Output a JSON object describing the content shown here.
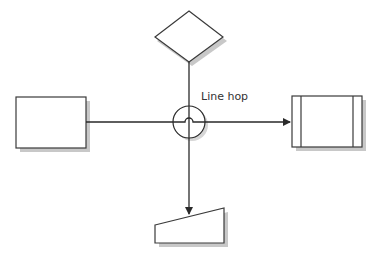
{
  "diagram": {
    "title": "",
    "labels": {
      "line_hop": "Line hop"
    },
    "shapes": [
      {
        "id": "decision",
        "type": "diamond"
      },
      {
        "id": "process",
        "type": "rectangle"
      },
      {
        "id": "predefined-process",
        "type": "predefined-process"
      },
      {
        "id": "manual-input",
        "type": "manual-input"
      },
      {
        "id": "hop-marker",
        "type": "circle"
      }
    ],
    "connectors": [
      {
        "from": "decision",
        "to": "manual-input",
        "arrow": "end"
      },
      {
        "from": "process",
        "to": "predefined-process",
        "arrow": "end",
        "hop": true
      }
    ],
    "colors": {
      "stroke": "#3a3a3a",
      "shadow": "#c8c8c8",
      "fill": "#ffffff"
    }
  }
}
